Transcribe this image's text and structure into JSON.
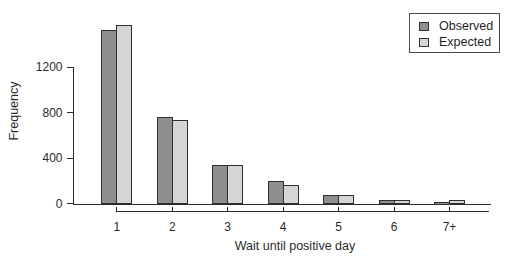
{
  "chart_data": {
    "type": "bar",
    "title": "",
    "xlabel": "Wait until positive day",
    "ylabel": "Frequency",
    "categories": [
      "1",
      "2",
      "3",
      "4",
      "5",
      "6",
      "7+"
    ],
    "series": [
      {
        "name": "Observed",
        "color": "#8e8e8e",
        "values": [
          1532,
          760,
          338,
          194,
          74,
          33,
          17
        ]
      },
      {
        "name": "Expected",
        "color": "#d5d5d5",
        "values": [
          1569,
          734,
          343,
          161,
          75,
          35,
          31
        ]
      }
    ],
    "y_ticks": [
      0,
      400,
      800,
      1200
    ],
    "ylim": [
      0,
      1600
    ],
    "grid": false,
    "legend_position": "top-right",
    "bar_border_color": "#2f2f2f",
    "axis_color": "#2b2b2b"
  }
}
